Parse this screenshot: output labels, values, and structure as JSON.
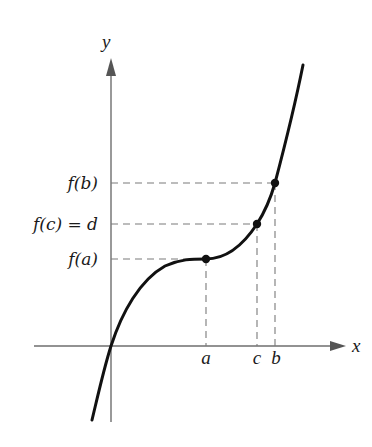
{
  "figure": {
    "axes": {
      "x_label": "x",
      "y_label": "y"
    },
    "y_labels": {
      "fb": "f(b)",
      "fc": "f(c) = d",
      "fa": "f(a)"
    },
    "x_ticks": {
      "a": "a",
      "c": "c",
      "b": "b"
    },
    "colors": {
      "curve": "#111111",
      "axis": "#6e6e6e",
      "dashed": "#7a7a7a",
      "text": "#1a1a1a"
    }
  }
}
